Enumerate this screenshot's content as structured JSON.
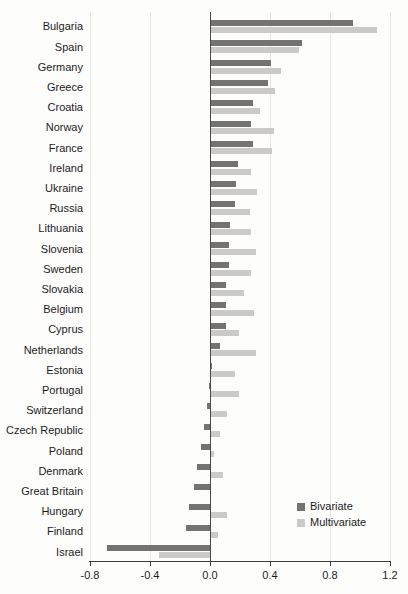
{
  "chart_data": {
    "type": "bar",
    "orientation": "horizontal",
    "title": "",
    "xlabel": "",
    "ylabel": "",
    "xlim": [
      -0.8,
      1.2
    ],
    "x_ticks": [
      -0.8,
      -0.4,
      0.0,
      0.4,
      0.8,
      1.2
    ],
    "x_tick_labels": [
      "-0.8",
      "-0.4",
      "0.0",
      "0.4",
      "0.8",
      "1.2"
    ],
    "grid": true,
    "legend_position": "bottom-right",
    "categories": [
      "Bulgaria",
      "Spain",
      "Germany",
      "Greece",
      "Croatia",
      "Norway",
      "France",
      "Ireland",
      "Ukraine",
      "Russia",
      "Lithuania",
      "Slovenia",
      "Sweden",
      "Slovakia",
      "Belgium",
      "Cyprus",
      "Netherlands",
      "Estonia",
      "Portugal",
      "Switzerland",
      "Czech Republic",
      "Poland",
      "Denmark",
      "Great Britain",
      "Hungary",
      "Finland",
      "Israel"
    ],
    "series": [
      {
        "name": "Bivariate",
        "color": "#757372",
        "values": [
          0.95,
          0.61,
          0.4,
          0.38,
          0.28,
          0.27,
          0.28,
          0.18,
          0.17,
          0.16,
          0.13,
          0.12,
          0.12,
          0.1,
          0.1,
          0.1,
          0.06,
          0.01,
          -0.01,
          -0.02,
          -0.04,
          -0.06,
          -0.09,
          -0.11,
          -0.14,
          -0.16,
          -0.69
        ]
      },
      {
        "name": "Multivariate",
        "color": "#cccac9",
        "values": [
          1.11,
          0.59,
          0.47,
          0.43,
          0.33,
          0.42,
          0.41,
          0.27,
          0.31,
          0.26,
          0.27,
          0.3,
          0.27,
          0.22,
          0.29,
          0.19,
          0.3,
          0.16,
          0.19,
          0.11,
          0.06,
          0.02,
          0.08,
          0.0,
          0.11,
          0.05,
          -0.34
        ]
      }
    ]
  },
  "legend": {
    "items": [
      {
        "label": "Bivariate",
        "color": "#757372"
      },
      {
        "label": "Multivariate",
        "color": "#cccac9"
      }
    ]
  },
  "colors": {
    "background": "#fdfdfc",
    "gridline": "#e9e5e5",
    "zero_line": "#4a4a4a",
    "axis": "#3d3d3d",
    "text": "#1c1c1c"
  }
}
